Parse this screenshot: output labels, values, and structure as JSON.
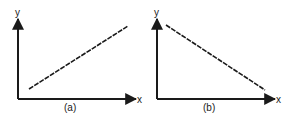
{
  "panels": [
    {
      "id": "a",
      "caption": "(a)",
      "x_axis_label": "x",
      "y_axis_label": "y",
      "relationship": "positive linear"
    },
    {
      "id": "b",
      "caption": "(b)",
      "x_axis_label": "x",
      "y_axis_label": "y",
      "relationship": "negative linear"
    }
  ],
  "colors": {
    "ink": "#1a1a1a",
    "background": "#ffffff"
  }
}
